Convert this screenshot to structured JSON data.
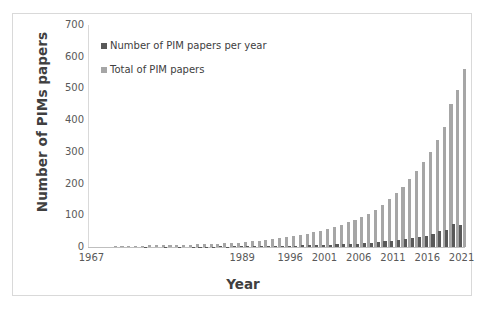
{
  "chart_data": {
    "type": "bar",
    "title": "",
    "xlabel": "Year",
    "ylabel": "Number of PIMs papers",
    "ylim": [
      0,
      700
    ],
    "ytick_step": 100,
    "yticks": [
      0,
      100,
      200,
      300,
      400,
      500,
      600,
      700
    ],
    "xticks": [
      1967,
      1989,
      1996,
      2001,
      2006,
      2011,
      2016,
      2021
    ],
    "grid": false,
    "legend_position": "top-left-inside",
    "colors": {
      "per_year": "#595959",
      "total": "#a6a6a6",
      "frame": "#d9d9d9",
      "axis": "#bfbfbf",
      "text": "#404040"
    },
    "series": [
      {
        "name": "Number of PIM papers per year",
        "color": "#595959",
        "values": [
          0,
          0,
          0,
          0,
          0,
          0,
          0,
          0,
          1,
          0,
          0,
          1,
          0,
          1,
          0,
          1,
          1,
          1,
          1,
          2,
          1,
          2,
          2,
          2,
          2,
          3,
          3,
          3,
          3,
          4,
          4,
          5,
          5,
          6,
          6,
          7,
          8,
          9,
          10,
          11,
          13,
          14,
          16,
          18,
          20,
          22,
          25,
          28,
          31,
          35,
          40,
          52,
          55,
          72,
          68
        ]
      },
      {
        "name": "Total of PIM papers",
        "color": "#a6a6a6",
        "values": [
          0,
          0,
          0,
          1,
          1,
          1,
          1,
          1,
          2,
          2,
          2,
          3,
          3,
          4,
          4,
          5,
          6,
          7,
          8,
          10,
          11,
          13,
          15,
          17,
          19,
          22,
          25,
          28,
          31,
          35,
          39,
          44,
          49,
          55,
          61,
          68,
          76,
          85,
          95,
          106,
          119,
          133,
          149,
          167,
          187,
          209,
          234,
          262,
          293,
          328,
          368,
          420,
          452,
          492,
          560
        ]
      }
    ],
    "categories": [
      1967,
      1968,
      1969,
      1970,
      1971,
      1972,
      1973,
      1974,
      1975,
      1976,
      1977,
      1978,
      1979,
      1980,
      1981,
      1982,
      1983,
      1984,
      1985,
      1986,
      1987,
      1988,
      1989,
      1990,
      1991,
      1992,
      1993,
      1994,
      1995,
      1996,
      1997,
      1998,
      1999,
      2000,
      2001,
      2002,
      2003,
      2004,
      2005,
      2006,
      2007,
      2008,
      2009,
      2010,
      2011,
      2012,
      2013,
      2014,
      2015,
      2016,
      2017,
      2018,
      2019,
      2020,
      2021
    ],
    "bar_heights_total": [
      0,
      0,
      0,
      4,
      4,
      4,
      4,
      4,
      5,
      5,
      5,
      6,
      6,
      7,
      7,
      8,
      9,
      10,
      11,
      12,
      13,
      14,
      16,
      18,
      20,
      22,
      25,
      28,
      31,
      34,
      38,
      42,
      47,
      52,
      57,
      64,
      70,
      78,
      86,
      95,
      105,
      118,
      133,
      150,
      169,
      190,
      214,
      240,
      269,
      300,
      337,
      380,
      452,
      494,
      560
    ],
    "bar_heights_year": [
      0,
      0,
      0,
      0,
      0,
      0,
      0,
      0,
      1,
      0,
      0,
      1,
      0,
      1,
      0,
      1,
      1,
      1,
      1,
      2,
      1,
      2,
      2,
      2,
      2,
      3,
      3,
      3,
      3,
      4,
      4,
      5,
      5,
      6,
      6,
      7,
      8,
      9,
      10,
      11,
      13,
      14,
      16,
      18,
      20,
      22,
      25,
      28,
      31,
      35,
      40,
      52,
      55,
      72,
      68
    ]
  },
  "legend": {
    "items": [
      {
        "label": "Number of PIM papers per year"
      },
      {
        "label": "Total of PIM papers"
      }
    ]
  }
}
